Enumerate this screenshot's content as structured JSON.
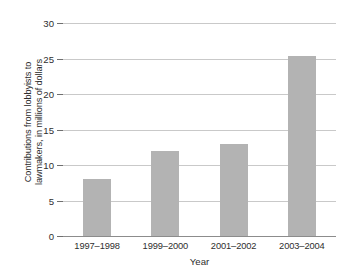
{
  "chart_data": {
    "type": "bar",
    "title": "",
    "categories": [
      "1997–1998",
      "1999–2000",
      "2001–2002",
      "2003–2004"
    ],
    "values": [
      8,
      12,
      13,
      25.3
    ],
    "xlabel": "Year",
    "ylabel": "Contributions from lobbyists to lawmakers, in millions of dollars",
    "ylabel_lines": [
      "Contributions from lobbyists to",
      "lawmakers, in millions of dollars"
    ],
    "ylim": [
      0,
      30
    ],
    "ytick_values": [
      0,
      5,
      10,
      15,
      20,
      25,
      30
    ],
    "ytick_labels": [
      "0",
      "5",
      "10",
      "15",
      "20",
      "25",
      "30"
    ],
    "grid": true,
    "grid_axis": "y",
    "legend": false,
    "legend_position": "none",
    "bar_color": "#b3b3b3",
    "gridline_color": "#c9c9c9",
    "axis_color": "#8c8c8c",
    "text_color": "#2e2e2e",
    "background_color": "#ffffff"
  }
}
